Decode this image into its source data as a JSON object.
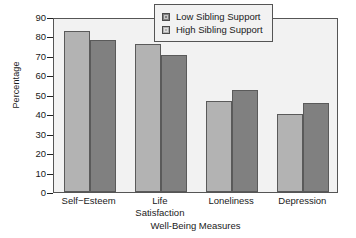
{
  "chart_data": {
    "type": "bar",
    "title": "",
    "categories": [
      "Self−Esteem",
      "Life Satisfaction",
      "Loneliness",
      "Depression"
    ],
    "series": [
      {
        "name": "High Sibling Support",
        "values": [
          83,
          76,
          47,
          40
        ],
        "color": "#b3b3b3"
      },
      {
        "name": "Low Sibling Support",
        "values": [
          78,
          70.5,
          52.5,
          46
        ],
        "color": "#808080"
      }
    ],
    "xlabel": "Well-Being Measures",
    "ylabel": "Percentage",
    "ylim": [
      0,
      90
    ],
    "yticks": [
      0,
      10,
      20,
      30,
      40,
      50,
      60,
      70,
      80,
      90
    ],
    "ytick_labels": [
      "0",
      "10",
      "20",
      "30",
      "40",
      "50",
      "60",
      "70",
      "80",
      "90"
    ],
    "grid": false,
    "legend_position": "top-right",
    "legend_entries": [
      {
        "label": "Low Sibling Support",
        "color": "#808080"
      },
      {
        "label": "High Sibling Support",
        "color": "#b3b3b3"
      }
    ]
  },
  "category_lines": [
    [
      "Self−Esteem",
      ""
    ],
    [
      "Life",
      "Satisfaction"
    ],
    [
      "Loneliness",
      ""
    ],
    [
      "Depression",
      ""
    ]
  ],
  "colors": {
    "plot_background": "#f2f2f2",
    "frame": "#555555",
    "bar_light": "#b3b3b3",
    "bar_dark": "#808080",
    "bar_outline": "#5a5a5a",
    "text": "#1a1a1a"
  }
}
